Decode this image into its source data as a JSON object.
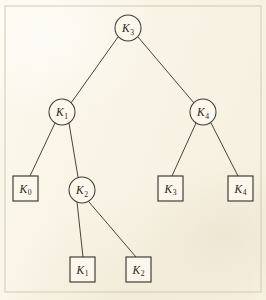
{
  "figure": {
    "type": "binary-search-tree",
    "background_color": "#fbf6e9",
    "line_color": "#4a433a",
    "frame_color": "#cfc6ae",
    "frame": {
      "x": 5,
      "y": 6,
      "width": 256,
      "height": 286
    }
  },
  "internal_nodes": [
    {
      "id": "n-k3",
      "key": "K",
      "subscript": "3",
      "label": "K3",
      "shape": "circle",
      "cx": 128,
      "cy": 28,
      "r": 13,
      "level": 0
    },
    {
      "id": "n-k1",
      "key": "K",
      "subscript": "1",
      "label": "K1",
      "shape": "circle",
      "cx": 62,
      "cy": 112,
      "r": 13,
      "level": 1
    },
    {
      "id": "n-k4",
      "key": "K",
      "subscript": "4",
      "label": "K4",
      "shape": "circle",
      "cx": 203,
      "cy": 112,
      "r": 13,
      "level": 1
    },
    {
      "id": "n-k2",
      "key": "K",
      "subscript": "2",
      "label": "K2",
      "shape": "circle",
      "cx": 82,
      "cy": 190,
      "r": 13,
      "level": 2
    }
  ],
  "external_nodes": [
    {
      "id": "e-k0",
      "key": "K",
      "subscript": "0",
      "label": "K0",
      "shape": "square",
      "x": 13,
      "y": 176,
      "size": 25,
      "level": 2
    },
    {
      "id": "e-k3",
      "key": "K",
      "subscript": "3",
      "label": "K3",
      "shape": "square",
      "x": 158,
      "y": 176,
      "size": 25,
      "level": 2
    },
    {
      "id": "e-k4",
      "key": "K",
      "subscript": "4",
      "label": "K4",
      "shape": "square",
      "x": 228,
      "y": 176,
      "size": 25,
      "level": 2
    },
    {
      "id": "e-k1",
      "key": "K",
      "subscript": "1",
      "label": "K1",
      "shape": "square",
      "x": 70,
      "y": 257,
      "size": 25,
      "level": 3
    },
    {
      "id": "e-k2",
      "key": "K",
      "subscript": "2",
      "label": "K2",
      "shape": "square",
      "x": 126,
      "y": 257,
      "size": 25,
      "level": 3
    }
  ],
  "edges": [
    {
      "id": "edge-k3-k1",
      "from": "n-k3",
      "to": "n-k1",
      "x1": 118,
      "y1": 37,
      "x2": 71,
      "y2": 103
    },
    {
      "id": "edge-k3-k4",
      "from": "n-k3",
      "to": "n-k4",
      "x1": 138,
      "y1": 37,
      "x2": 194,
      "y2": 103
    },
    {
      "id": "edge-k1-k0",
      "from": "n-k1",
      "to": "e-k0",
      "x1": 55,
      "y1": 123,
      "x2": 30,
      "y2": 176
    },
    {
      "id": "edge-k1-k2",
      "from": "n-k1",
      "to": "n-k2",
      "x1": 69,
      "y1": 123,
      "x2": 78,
      "y2": 177
    },
    {
      "id": "edge-k4-e3",
      "from": "n-k4",
      "to": "e-k3",
      "x1": 196,
      "y1": 123,
      "x2": 172,
      "y2": 176
    },
    {
      "id": "edge-k4-e4",
      "from": "n-k4",
      "to": "e-k4",
      "x1": 211,
      "y1": 123,
      "x2": 238,
      "y2": 176
    },
    {
      "id": "edge-k2-e1",
      "from": "n-k2",
      "to": "e-k1",
      "x1": 77,
      "y1": 202,
      "x2": 83,
      "y2": 257
    },
    {
      "id": "edge-k2-e2",
      "from": "n-k2",
      "to": "e-k2",
      "x1": 89,
      "y1": 202,
      "x2": 136,
      "y2": 257
    }
  ]
}
